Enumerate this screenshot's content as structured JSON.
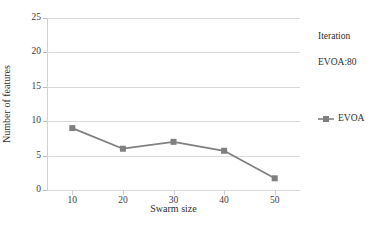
{
  "chart_data": {
    "type": "line",
    "title": "",
    "xlabel": "Swarm size",
    "ylabel": "Number of features",
    "x": [
      10,
      20,
      30,
      40,
      50
    ],
    "categories": [
      "10",
      "20",
      "30",
      "40",
      "50"
    ],
    "series": [
      {
        "name": "EVOA",
        "values": [
          9,
          6,
          7,
          5.7,
          1.7
        ],
        "color": "#808080",
        "marker": "square"
      }
    ],
    "xlim": [
      5,
      55
    ],
    "ylim": [
      0,
      25
    ],
    "ytick_labels": [
      "0",
      "5",
      "10",
      "15",
      "20",
      "25"
    ],
    "ytick_values": [
      0,
      5,
      10,
      15,
      20,
      25
    ],
    "grid": "horizontal",
    "legend_position": "right"
  },
  "annotations": {
    "iteration_label": "Iteration",
    "iteration_value": "EVOA:80"
  },
  "colors": {
    "series": "#808080",
    "gridline": "#d9d9d9",
    "text": "#2e2e2e"
  }
}
